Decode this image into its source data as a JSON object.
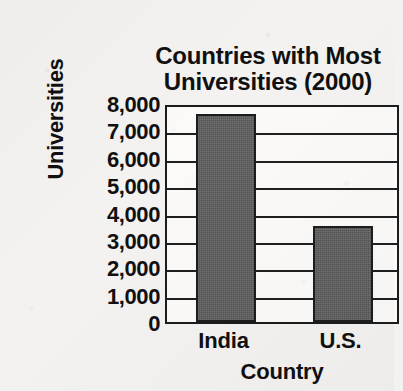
{
  "chart_data": {
    "type": "bar",
    "title": "Countries with Most Universities (2000)",
    "title_lines": [
      "Countries with Most",
      "Universities (2000)"
    ],
    "xlabel": "Country",
    "ylabel": "Universities",
    "categories": [
      "India",
      "U.S."
    ],
    "values": [
      7600,
      3500
    ],
    "ylim": [
      0,
      8000
    ],
    "ytick_step": 1000,
    "ytick_labels": [
      "8,000",
      "7,000",
      "6,000",
      "5,000",
      "4,000",
      "3,000",
      "2,000",
      "1,000",
      "0"
    ],
    "ytick_values": [
      8000,
      7000,
      6000,
      5000,
      4000,
      3000,
      2000,
      1000,
      0
    ],
    "grid": true,
    "grid_axis": "y",
    "legend": false,
    "bar_color": "#5c5c5c",
    "axis_color": "#1c1c1c",
    "background_color": "#f3f2f0",
    "plot_background_color": "#fbfaf8"
  }
}
